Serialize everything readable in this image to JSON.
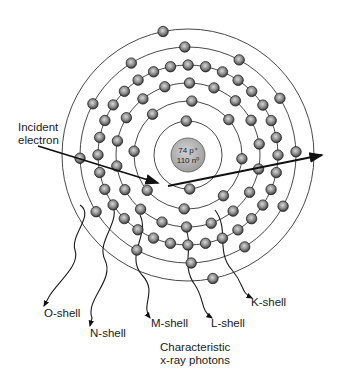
{
  "diagram": {
    "nucleus": {
      "protons": "74 p⁺",
      "neutrons": "110 n⁰",
      "center": [
        188,
        155
      ],
      "radius": 17,
      "fill": "#b5b5b5"
    },
    "shell_radii": [
      34,
      54,
      72,
      90,
      108,
      126
    ],
    "electron_color": "#8c8c8c",
    "labels": {
      "incident": [
        "Incident",
        "electron"
      ],
      "o_shell": "O-shell",
      "n_shell": "N-shell",
      "m_shell": "M-shell",
      "l_shell": "L-shell",
      "k_shell": "K-shell",
      "caption": [
        "Characteristic",
        "x-ray photons"
      ]
    }
  }
}
